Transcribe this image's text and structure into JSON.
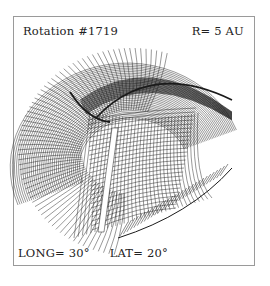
{
  "figure": {
    "title": "Rotation #1719",
    "radius": "R= 5 AU",
    "longitude": "LONG= 30°",
    "latitude": "LAT= 20°",
    "line_color": "#1a1a1a",
    "frame_color": "#9a9a9a"
  }
}
